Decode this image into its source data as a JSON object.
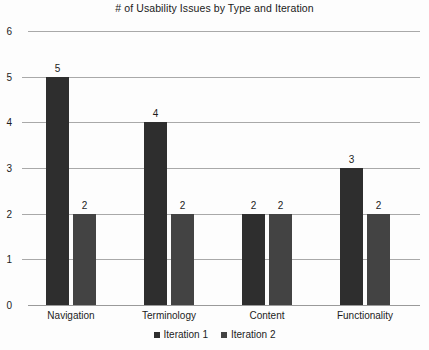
{
  "chart_data": {
    "type": "bar",
    "title": "# of Usability Issues by Type and Iteration",
    "xlabel": "",
    "ylabel": "",
    "categories": [
      "Navigation",
      "Terminology",
      "Content",
      "Functionality"
    ],
    "series": [
      {
        "name": "Iteration 1",
        "values": [
          5,
          4,
          2,
          3
        ],
        "color": "#2e2e2e"
      },
      {
        "name": "Iteration 2",
        "values": [
          2,
          2,
          2,
          2
        ],
        "color": "#434343"
      }
    ],
    "ylim": [
      0,
      6
    ],
    "yticks": [
      0,
      1,
      2,
      3,
      4,
      5,
      6
    ],
    "ytick_labels": [
      "0",
      "1",
      "2",
      "3",
      "4",
      "5",
      "6"
    ],
    "grid": true,
    "data_labels": true,
    "legend_position": "bottom",
    "background_color": "#fdfdfd",
    "gridline_color": "#a9a9a9"
  }
}
